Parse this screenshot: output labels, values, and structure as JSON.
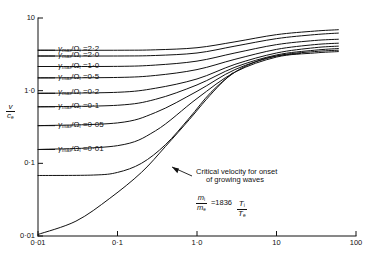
{
  "chart_data": {
    "type": "line",
    "title": "",
    "xlabel": "T_i/T_e",
    "ylabel": "v/c_e",
    "xscale": "log",
    "yscale": "log",
    "xlim": [
      0.01,
      100
    ],
    "ylim": [
      0.01,
      10
    ],
    "grid": false,
    "legend_position": "inline-labels",
    "xticks": [
      "0·01",
      "0·1",
      "1·0",
      "10",
      "100"
    ],
    "xtick_values": [
      0.01,
      0.1,
      1.0,
      10,
      100
    ],
    "yticks": [
      "0·01",
      "0·1",
      "1·0",
      "10"
    ],
    "ytick_values": [
      0.01,
      0.1,
      1.0,
      10
    ],
    "annotations": [
      {
        "name": "critical-velocity-note",
        "line1": "Critical velocity for onset",
        "line2": "of growing waves"
      },
      {
        "name": "mass-ratio-note",
        "numerator": "m",
        "numerator_sub": "i",
        "denominator": "m",
        "denominator_sub": "e",
        "value": "=1836"
      }
    ],
    "series": [
      {
        "name": "gamma_max/Omega_i = 2.2",
        "label_value": "2·2",
        "start_y": 3.6,
        "end_y": 6.8,
        "points": [
          [
            0.01,
            3.6
          ],
          [
            0.1,
            3.6
          ],
          [
            0.3,
            3.65
          ],
          [
            1.0,
            3.9
          ],
          [
            3.0,
            4.7
          ],
          [
            10,
            5.9
          ],
          [
            30,
            6.6
          ],
          [
            60,
            6.9
          ]
        ]
      },
      {
        "name": "gamma_max/Omega_i = 2.0",
        "label_value": "2·0",
        "start_y": 3.0,
        "end_y": 6.1,
        "points": [
          [
            0.01,
            3.0
          ],
          [
            0.1,
            3.0
          ],
          [
            0.3,
            3.05
          ],
          [
            1.0,
            3.3
          ],
          [
            3.0,
            4.1
          ],
          [
            10,
            5.2
          ],
          [
            30,
            5.9
          ],
          [
            60,
            6.2
          ]
        ]
      },
      {
        "name": "gamma_max/Omega_i = 1.0",
        "label_value": "1·0",
        "start_y": 2.15,
        "end_y": 5.0,
        "points": [
          [
            0.01,
            2.15
          ],
          [
            0.1,
            2.16
          ],
          [
            0.3,
            2.25
          ],
          [
            1.0,
            2.55
          ],
          [
            3.0,
            3.3
          ],
          [
            10,
            4.3
          ],
          [
            30,
            4.9
          ],
          [
            60,
            5.1
          ]
        ]
      },
      {
        "name": "gamma_max/Omega_i = 0.5",
        "label_value": "0·5",
        "start_y": 1.5,
        "end_y": 4.4,
        "points": [
          [
            0.01,
            1.5
          ],
          [
            0.1,
            1.52
          ],
          [
            0.3,
            1.62
          ],
          [
            1.0,
            1.95
          ],
          [
            3.0,
            2.7
          ],
          [
            10,
            3.7
          ],
          [
            30,
            4.3
          ],
          [
            60,
            4.5
          ]
        ]
      },
      {
        "name": "gamma_max/Omega_i = 0.2",
        "label_value": "0·2",
        "start_y": 0.92,
        "end_y": 4.0,
        "points": [
          [
            0.01,
            0.92
          ],
          [
            0.1,
            0.95
          ],
          [
            0.3,
            1.08
          ],
          [
            1.0,
            1.45
          ],
          [
            3.0,
            2.3
          ],
          [
            10,
            3.3
          ],
          [
            30,
            3.9
          ],
          [
            60,
            4.1
          ]
        ]
      },
      {
        "name": "gamma_max/Omega_i = 0.1",
        "label_value": "0·1",
        "start_y": 0.6,
        "end_y": 3.7,
        "points": [
          [
            0.01,
            0.6
          ],
          [
            0.1,
            0.63
          ],
          [
            0.3,
            0.76
          ],
          [
            1.0,
            1.2
          ],
          [
            3.0,
            2.1
          ],
          [
            10,
            3.1
          ],
          [
            30,
            3.6
          ],
          [
            60,
            3.8
          ]
        ]
      },
      {
        "name": "gamma_max/Omega_i = 0.05",
        "label_value": "0·05",
        "start_y": 0.33,
        "end_y": 3.5,
        "points": [
          [
            0.01,
            0.33
          ],
          [
            0.1,
            0.36
          ],
          [
            0.3,
            0.5
          ],
          [
            1.0,
            0.98
          ],
          [
            3.0,
            1.95
          ],
          [
            10,
            3.0
          ],
          [
            30,
            3.45
          ],
          [
            60,
            3.6
          ]
        ]
      },
      {
        "name": "gamma_max/Omega_i = 0.01",
        "label_value": "0·01",
        "start_y": 0.155,
        "end_y": 3.35,
        "points": [
          [
            0.01,
            0.155
          ],
          [
            0.1,
            0.175
          ],
          [
            0.3,
            0.28
          ],
          [
            1.0,
            0.78
          ],
          [
            3.0,
            1.8
          ],
          [
            10,
            2.9
          ],
          [
            30,
            3.3
          ],
          [
            60,
            3.45
          ]
        ]
      },
      {
        "name": "critical-velocity-curve",
        "label_value": "",
        "start_y": 0.068,
        "end_y": 3.3,
        "points": [
          [
            0.01,
            0.068
          ],
          [
            0.05,
            0.069
          ],
          [
            0.1,
            0.075
          ],
          [
            0.2,
            0.1
          ],
          [
            0.4,
            0.18
          ],
          [
            0.8,
            0.42
          ],
          [
            1.5,
            0.95
          ],
          [
            3.0,
            1.8
          ],
          [
            6.0,
            2.6
          ],
          [
            10,
            3.0
          ],
          [
            20,
            3.25
          ]
        ]
      },
      {
        "name": "lower-boundary-curve",
        "label_value": "",
        "start_y": 0.0105,
        "end_y": 1.8,
        "points": [
          [
            0.01,
            0.0105
          ],
          [
            0.03,
            0.016
          ],
          [
            0.08,
            0.033
          ],
          [
            0.2,
            0.075
          ],
          [
            0.4,
            0.17
          ],
          [
            0.8,
            0.4
          ],
          [
            1.3,
            0.75
          ],
          [
            2.0,
            1.25
          ],
          [
            2.8,
            1.75
          ]
        ]
      }
    ]
  },
  "axis": {
    "y_label_num": "v",
    "y_label_den": "c",
    "y_label_den_sub": "e",
    "x_label_num": "T",
    "x_label_num_sub": "i",
    "x_label_den": "T",
    "x_label_den_sub": "e"
  },
  "curve_labels": {
    "prefix_gamma": "γ",
    "prefix_sub": "max",
    "slash": "/",
    "omega": "Ω",
    "omega_sub": "i",
    "equals": "="
  }
}
